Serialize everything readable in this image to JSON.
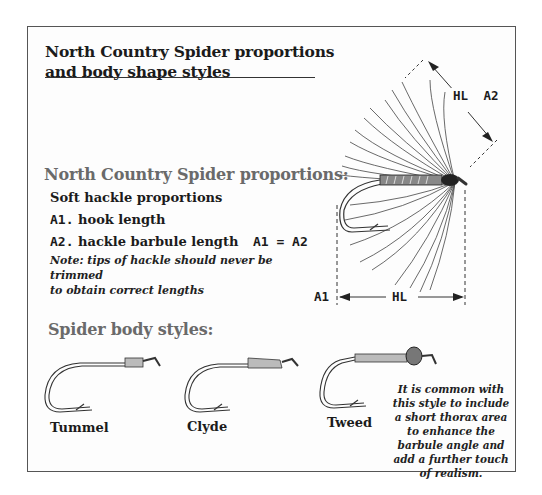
{
  "title": {
    "line1": "North Country Spider proportions",
    "line2": "and body shape styles"
  },
  "proportions": {
    "heading": "North Country Spider proportions:",
    "subheading": "Soft hackle proportions",
    "item_a1_code": "A1.",
    "item_a1_text": "hook length",
    "item_a2_code": "A2.",
    "item_a2_text": "hackle barbule length",
    "equation": "A1 = A2",
    "note_line1": "Note:  tips of hackle should never be trimmed",
    "note_line2": "to obtain correct lengths"
  },
  "diagram": {
    "top_dim_label_hl": "HL",
    "top_dim_label_a2": "A2",
    "bottom_dim_label_a1": "A1",
    "bottom_dim_label_hl": "HL"
  },
  "body_styles": {
    "heading": "Spider body styles:",
    "styles": [
      {
        "name": "Tummel"
      },
      {
        "name": "Clyde"
      },
      {
        "name": "Tweed"
      }
    ],
    "caption": "It is common with this style to include a short thorax area to enhance the barbule angle and add a further touch of realism."
  },
  "colors": {
    "frame": "#555555",
    "heading_gray": "#6a6a6a",
    "text": "#1b1b1b"
  }
}
